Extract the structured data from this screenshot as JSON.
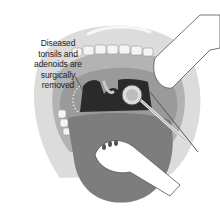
{
  "diagram": {
    "annotation": {
      "lines": [
        "Diseased",
        "tonsils and",
        "adenoids are",
        "surgically",
        "removed"
      ]
    },
    "elements": [
      "lips",
      "upper-teeth",
      "mouth-cavity",
      "throat-opening",
      "excised-tonsil-site",
      "dental-mirror",
      "surgical-instrument",
      "gloved-hand-upper",
      "gloved-hand-lower",
      "tongue"
    ],
    "colors": {
      "lips": "#d8d8d8",
      "inner_mouth": "#9a9a9a",
      "throat": "#2a2a2a",
      "tongue": "#7d7d7d",
      "teeth": "#f4f4f4",
      "glove": "#ffffff",
      "outline": "#555555"
    }
  }
}
